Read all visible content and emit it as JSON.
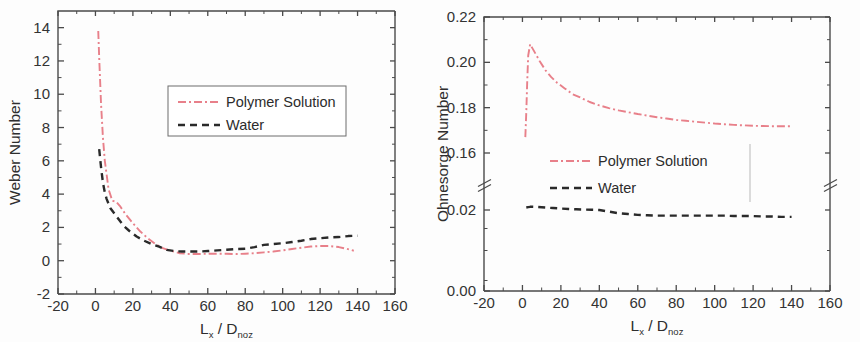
{
  "figure": {
    "background": "#fdfdfd",
    "width": 860,
    "height": 342
  },
  "colors": {
    "polymer": "#e8808a",
    "water": "#2a2a2a",
    "axis": "#4a4a4a",
    "text": "#2e2e2e"
  },
  "chart_data": [
    {
      "type": "line",
      "id": "weber-number-chart",
      "title": "",
      "xlabel": "L_x / D_noz",
      "xlabel_main": "L",
      "xlabel_sub1": "x",
      "xlabel_mid": " / D",
      "xlabel_sub2": "noz",
      "ylabel": "Weber Number",
      "xlim": [
        -20,
        160
      ],
      "ylim": [
        -2,
        15
      ],
      "xticks": [
        -20,
        0,
        20,
        40,
        60,
        80,
        100,
        120,
        140,
        160
      ],
      "xticklabels": [
        "-20",
        "0",
        "20",
        "40",
        "60",
        "80",
        "100",
        "120",
        "140",
        "160"
      ],
      "yticks": [
        -2,
        0,
        2,
        4,
        6,
        8,
        10,
        12,
        14
      ],
      "yticklabels": [
        "-2",
        "0",
        "2",
        "4",
        "6",
        "8",
        "10",
        "12",
        "14"
      ],
      "grid": false,
      "legend_position": "upper-center",
      "legend_boxed": true,
      "axis_break": false,
      "series": [
        {
          "name": "Polymer Solution",
          "color": "#e8808a",
          "dash": "dashdot",
          "x": [
            1.5,
            2,
            3,
            4,
            5,
            7,
            9,
            11,
            13,
            16,
            20,
            24,
            28,
            32,
            36,
            40,
            45,
            50,
            55,
            60,
            65,
            70,
            75,
            80,
            85,
            90,
            95,
            100,
            105,
            110,
            115,
            120,
            125,
            130,
            134,
            138
          ],
          "y": [
            13.8,
            12.2,
            9.4,
            7.4,
            6.0,
            4.3,
            3.6,
            3.55,
            3.3,
            2.8,
            2.25,
            1.75,
            1.35,
            1.0,
            0.75,
            0.6,
            0.45,
            0.4,
            0.4,
            0.42,
            0.42,
            0.42,
            0.4,
            0.42,
            0.45,
            0.5,
            0.55,
            0.62,
            0.7,
            0.78,
            0.85,
            0.88,
            0.88,
            0.82,
            0.72,
            0.6
          ]
        },
        {
          "name": "Water",
          "color": "#2a2a2a",
          "dash": "dashed",
          "x": [
            2,
            3,
            4,
            5,
            6,
            8,
            10,
            12,
            15,
            18,
            22,
            26,
            30,
            34,
            38,
            42,
            46,
            50,
            55,
            60,
            65,
            70,
            75,
            80,
            85,
            90,
            95,
            100,
            105,
            110,
            115,
            120,
            125,
            130,
            135,
            140
          ],
          "y": [
            6.7,
            5.6,
            4.7,
            4.1,
            3.7,
            3.15,
            2.85,
            2.55,
            2.1,
            1.8,
            1.45,
            1.2,
            1.0,
            0.85,
            0.65,
            0.58,
            0.55,
            0.55,
            0.55,
            0.58,
            0.62,
            0.66,
            0.7,
            0.72,
            0.82,
            0.95,
            1.0,
            1.05,
            1.12,
            1.2,
            1.3,
            1.35,
            1.4,
            1.42,
            1.48,
            1.5
          ]
        }
      ]
    },
    {
      "type": "line",
      "id": "ohnesorge-number-chart",
      "title": "",
      "xlabel": "L_x / D_noz",
      "xlabel_main": "L",
      "xlabel_sub1": "x",
      "xlabel_mid": " / D",
      "xlabel_sub2": "noz",
      "ylabel": "Ohnesorge Number",
      "xlim": [
        -20,
        160
      ],
      "ylim": [
        0.0,
        0.22
      ],
      "xticks": [
        -20,
        0,
        20,
        40,
        60,
        80,
        100,
        120,
        140,
        160
      ],
      "xticklabels": [
        "-20",
        "0",
        "20",
        "40",
        "60",
        "80",
        "100",
        "120",
        "140",
        "160"
      ],
      "yticks": [
        0.0,
        0.02,
        0.16,
        0.18,
        0.2,
        0.22
      ],
      "yticklabels": [
        "0.00",
        "0.02",
        "0.16",
        "0.18",
        "0.20",
        "0.22"
      ],
      "grid": false,
      "legend_position": "middle-center",
      "legend_boxed": false,
      "axis_break": true,
      "axis_break_between": [
        0.02,
        0.16
      ],
      "series": [
        {
          "name": "Polymer Solution",
          "color": "#e8808a",
          "dash": "dashdot",
          "x": [
            1.5,
            2,
            2.5,
            3,
            4,
            5,
            7,
            9,
            12,
            15,
            18,
            22,
            26,
            30,
            35,
            40,
            45,
            50,
            55,
            60,
            65,
            70,
            75,
            80,
            85,
            90,
            95,
            100,
            105,
            110,
            115,
            120,
            125,
            130,
            135,
            140
          ],
          "y": [
            0.167,
            0.178,
            0.192,
            0.203,
            0.208,
            0.2065,
            0.2035,
            0.2005,
            0.1965,
            0.1935,
            0.191,
            0.1885,
            0.186,
            0.1845,
            0.1825,
            0.181,
            0.1798,
            0.1788,
            0.178,
            0.1772,
            0.1765,
            0.1758,
            0.1752,
            0.1746,
            0.1742,
            0.1738,
            0.1734,
            0.173,
            0.1727,
            0.1724,
            0.1722,
            0.172,
            0.1719,
            0.1718,
            0.1718,
            0.1718
          ]
        },
        {
          "name": "Water",
          "color": "#2a2a2a",
          "dash": "dashed",
          "x": [
            2,
            3,
            4,
            5,
            6,
            8,
            10,
            13,
            16,
            20,
            24,
            28,
            32,
            36,
            40,
            45,
            50,
            55,
            60,
            65,
            70,
            75,
            80,
            85,
            90,
            95,
            100,
            105,
            110,
            115,
            120,
            125,
            130,
            135,
            140
          ],
          "y": [
            0.0262,
            0.0272,
            0.0278,
            0.0279,
            0.0278,
            0.0274,
            0.0268,
            0.0258,
            0.0248,
            0.0236,
            0.0226,
            0.0218,
            0.0211,
            0.0206,
            0.0201,
            0.0196,
            0.0192,
            0.019,
            0.0188,
            0.0187,
            0.0186,
            0.0186,
            0.0186,
            0.0186,
            0.0186,
            0.0186,
            0.0186,
            0.0186,
            0.0185,
            0.0185,
            0.0185,
            0.0184,
            0.0184,
            0.0183,
            0.0183
          ]
        }
      ]
    }
  ],
  "legend": {
    "polymer_label": "Polymer Solution",
    "water_label": "Water"
  }
}
